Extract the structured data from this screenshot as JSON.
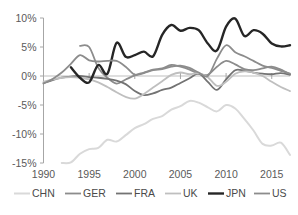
{
  "chart_data": {
    "type": "line",
    "title": "",
    "subtitle": "",
    "xlabel": "",
    "ylabel": "",
    "xlim": [
      1990,
      2017
    ],
    "ylim": [
      -15,
      10
    ],
    "x_ticks": [
      "1990",
      "1995",
      "2000",
      "2005",
      "2010",
      "2015"
    ],
    "x_tick_values": [
      1990,
      1995,
      2000,
      2005,
      2010,
      2015
    ],
    "y_ticks": [
      "10%",
      "5%",
      "0%",
      "-5%",
      "-10%",
      "-15%"
    ],
    "y_tick_values": [
      10,
      5,
      0,
      -5,
      -10,
      -15
    ],
    "grid": false,
    "zero_line": true,
    "legend_position": "bottom",
    "series": [
      {
        "name": "CHN",
        "color": "#d9d9d9",
        "width": 2.0,
        "x": [
          1992,
          1993,
          1994,
          1995,
          1996,
          1997,
          1998,
          1999,
          2000,
          2001,
          2002,
          2003,
          2004,
          2005,
          2006,
          2007,
          2008,
          2009,
          2010,
          2011,
          2012,
          2013,
          2014,
          2015,
          2016,
          2017
        ],
        "values": [
          -15.0,
          -14.9,
          -13.4,
          -12.6,
          -12.4,
          -11.0,
          -11.3,
          -10.2,
          -9.0,
          -8.3,
          -7.4,
          -6.9,
          -5.8,
          -5.2,
          -4.3,
          -4.6,
          -5.4,
          -6.1,
          -5.0,
          -5.6,
          -7.4,
          -9.4,
          -11.7,
          -12.0,
          -11.5,
          -13.6
        ]
      },
      {
        "name": "GER",
        "color": "#8c8c8c",
        "width": 1.8,
        "x": [
          1994,
          1995,
          1996,
          1997,
          1998,
          1999,
          2000,
          2001,
          2002,
          2003,
          2004,
          2005,
          2006,
          2007,
          2008,
          2009,
          2010,
          2011,
          2012,
          2013,
          2014,
          2015,
          2016,
          2017
        ],
        "values": [
          5.2,
          5.0,
          1.4,
          -0.3,
          -1.3,
          -0.6,
          0.1,
          0.6,
          1.1,
          1.3,
          1.9,
          1.6,
          1.1,
          0.4,
          0.2,
          1.6,
          2.6,
          2.0,
          1.2,
          1.0,
          1.3,
          1.6,
          1.1,
          0.3
        ]
      },
      {
        "name": "FRA",
        "color": "#737373",
        "width": 1.8,
        "x": [
          1990,
          1991,
          1992,
          1993,
          1994,
          1995,
          1996,
          1997,
          1998,
          1999,
          2000,
          2001,
          2002,
          2003,
          2004,
          2005,
          2006,
          2007,
          2008,
          2009,
          2010,
          2011,
          2012,
          2013,
          2014,
          2015,
          2016,
          2017
        ],
        "values": [
          -1.2,
          -0.7,
          -0.3,
          -0.1,
          0.0,
          -0.2,
          -0.3,
          -0.5,
          -0.8,
          -1.4,
          -2.6,
          -3.3,
          -3.0,
          -2.4,
          -2.0,
          -1.2,
          -0.4,
          0.4,
          -1.0,
          -2.4,
          -0.6,
          1.0,
          0.9,
          0.6,
          0.4,
          0.3,
          0.5,
          0.2
        ]
      },
      {
        "name": "UK",
        "color": "#bfbfbf",
        "width": 1.8,
        "x": [
          1990,
          1991,
          1992,
          1993,
          1994,
          1995,
          1996,
          1997,
          1998,
          1999,
          2000,
          2001,
          2002,
          2003,
          2004,
          2005,
          2006,
          2007,
          2008,
          2009,
          2010,
          2011,
          2012,
          2013,
          2014,
          2015,
          2016,
          2017
        ],
        "values": [
          -1.0,
          -0.6,
          -0.3,
          -0.2,
          -0.3,
          -0.6,
          -1.1,
          -1.9,
          -2.8,
          -3.6,
          -3.9,
          -3.1,
          -2.0,
          -0.9,
          0.2,
          0.6,
          0.3,
          0.5,
          -0.2,
          -1.7,
          -1.0,
          0.4,
          0.8,
          0.6,
          0.0,
          -1.0,
          -1.9,
          -2.6
        ]
      },
      {
        "name": "JPN",
        "color": "#262626",
        "width": 2.4,
        "x": [
          1993,
          1994,
          1995,
          1996,
          1997,
          1998,
          1999,
          2000,
          2001,
          2002,
          2003,
          2004,
          2005,
          2006,
          2007,
          2008,
          2009,
          2010,
          2011,
          2012,
          2013,
          2014,
          2015,
          2016,
          2017
        ],
        "values": [
          1.5,
          -0.3,
          -1.1,
          1.9,
          0.4,
          5.7,
          3.3,
          3.6,
          4.2,
          3.4,
          7.1,
          8.8,
          7.8,
          8.3,
          7.9,
          5.6,
          4.4,
          8.5,
          9.9,
          6.9,
          7.9,
          7.3,
          5.6,
          5.1,
          5.3
        ]
      },
      {
        "name": "US",
        "color": "#8c8c8c",
        "width": 1.8,
        "x": [
          1990,
          1991,
          1992,
          1993,
          1994,
          1995,
          1996,
          1997,
          1998,
          1999,
          2000,
          2001,
          2002,
          2003,
          2004,
          2005,
          2006,
          2007,
          2008,
          2009,
          2010,
          2011,
          2012,
          2013,
          2014,
          2015,
          2016,
          2017
        ],
        "values": [
          -1.3,
          -0.5,
          0.6,
          2.1,
          3.6,
          2.7,
          2.5,
          2.6,
          2.6,
          1.6,
          0.2,
          0.5,
          1.0,
          1.2,
          1.6,
          1.8,
          1.4,
          0.6,
          0.0,
          3.0,
          5.3,
          4.1,
          3.4,
          2.6,
          1.8,
          1.4,
          0.9,
          0.4
        ]
      }
    ]
  },
  "legend": {
    "items": [
      {
        "label": "CHN"
      },
      {
        "label": "GER"
      },
      {
        "label": "FRA"
      },
      {
        "label": "UK"
      },
      {
        "label": "JPN"
      },
      {
        "label": "US"
      }
    ]
  }
}
